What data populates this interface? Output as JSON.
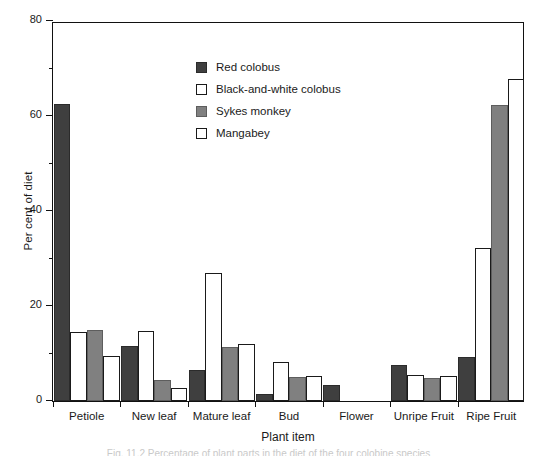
{
  "chart_data": {
    "type": "bar",
    "title": "",
    "xlabel": "Plant item",
    "ylabel": "Per cent of diet",
    "categories": [
      "Petiole",
      "New leaf",
      "Mature leaf",
      "Bud",
      "Flower",
      "Unripe Fruit",
      "Ripe Fruit"
    ],
    "series": [
      {
        "name": "Red colobus",
        "swatch": "#3f3f3f",
        "values": [
          62.5,
          11.5,
          6.5,
          1.5,
          3.3,
          7.5,
          9.3
        ]
      },
      {
        "name": "Black-and-white colobus",
        "swatch": "#ffffff",
        "values": [
          14.5,
          14.8,
          27.0,
          8.3,
          0,
          5.5,
          32.3
        ]
      },
      {
        "name": "Sykes monkey",
        "swatch": "#808080",
        "values": [
          15.0,
          4.5,
          11.3,
          5.0,
          0,
          4.8,
          62.3
        ]
      },
      {
        "name": "Mangabey",
        "swatch": "#ffffff",
        "values": [
          9.5,
          2.8,
          12.0,
          5.3,
          0,
          5.3,
          67.8
        ]
      }
    ],
    "ylim": [
      0,
      80
    ],
    "yticks": [
      0,
      20,
      40,
      60,
      80
    ],
    "yminorticks": [
      10,
      30,
      50,
      70
    ],
    "grid": false,
    "legend_position": "upper center"
  },
  "axis": {
    "y_title": "Per cent of diet",
    "x_title": "Plant item"
  },
  "caption": "Fig. 11.2 Percentage of plant parts in the diet of the four colobine species"
}
